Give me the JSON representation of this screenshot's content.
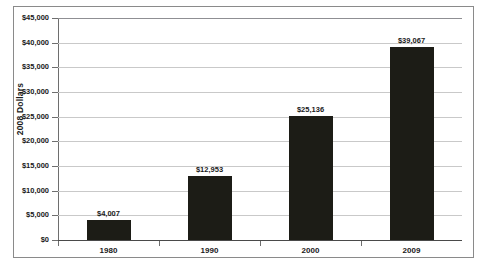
{
  "chart_data": {
    "type": "bar",
    "title": "",
    "xlabel": "",
    "ylabel": "2008 Dollars",
    "categories": [
      "1980",
      "1990",
      "2000",
      "2009"
    ],
    "values": [
      4007,
      12953,
      25136,
      39067
    ],
    "value_labels": [
      "$4,007",
      "$12,953",
      "$25,136",
      "$39,067"
    ],
    "ylim": [
      0,
      45000
    ],
    "ytick_values": [
      0,
      5000,
      10000,
      15000,
      20000,
      25000,
      30000,
      35000,
      40000,
      45000
    ],
    "ytick_labels": [
      "$0",
      "$5,000",
      "$10,000",
      "$15,000",
      "$20,000",
      "$25,000",
      "$30,000",
      "$35,000",
      "$40,000",
      "$45,000"
    ],
    "grid": true,
    "grid_axis": "y",
    "legend": false,
    "legend_position": "none",
    "bar_color": "#1c1c16",
    "gridline_color": "#c9c9c9",
    "axis_color": "#6e6e6e",
    "border_color": "#8a8a8a",
    "background_color": "#ffffff"
  }
}
